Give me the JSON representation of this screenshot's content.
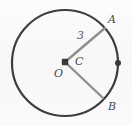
{
  "figure": {
    "background_color": "#fbfbfb",
    "circle": {
      "name": "circle",
      "center_x": 65,
      "center_y": 63,
      "radius": 53,
      "stroke_color": "#3d3d3d",
      "stroke_width": 2.2,
      "fill": "none"
    },
    "radii": [
      {
        "name": "segment-OA",
        "from": "O",
        "to": "A",
        "x1": 65,
        "y1": 62,
        "x2": 105,
        "y2": 28,
        "stroke_color": "#8f8f8f",
        "stroke_width": 2.4
      },
      {
        "name": "segment-OB",
        "from": "O",
        "to": "B",
        "x1": 65,
        "y1": 62,
        "x2": 103,
        "y2": 98,
        "stroke_color": "#8f8f8f",
        "stroke_width": 2.4
      }
    ],
    "points": [
      {
        "name": "center-point-O",
        "x": 65,
        "y": 62,
        "radius": 3.2,
        "color": "#3a3a3a",
        "shape": "square-dot"
      },
      {
        "name": "circle-point-right",
        "x": 118,
        "y": 63,
        "radius": 3.0,
        "color": "#3a3a3a",
        "shape": "dot"
      }
    ],
    "labels": [
      {
        "name": "label-A",
        "text": "A",
        "x": 108,
        "y": 14
      },
      {
        "name": "label-B",
        "text": "B",
        "x": 108,
        "y": 101
      },
      {
        "name": "label-C",
        "text": "C",
        "x": 75,
        "y": 56
      },
      {
        "name": "label-O",
        "text": "O",
        "x": 54,
        "y": 68
      },
      {
        "name": "label-measure-3",
        "text": "3",
        "x": 77,
        "y": 30
      }
    ]
  }
}
